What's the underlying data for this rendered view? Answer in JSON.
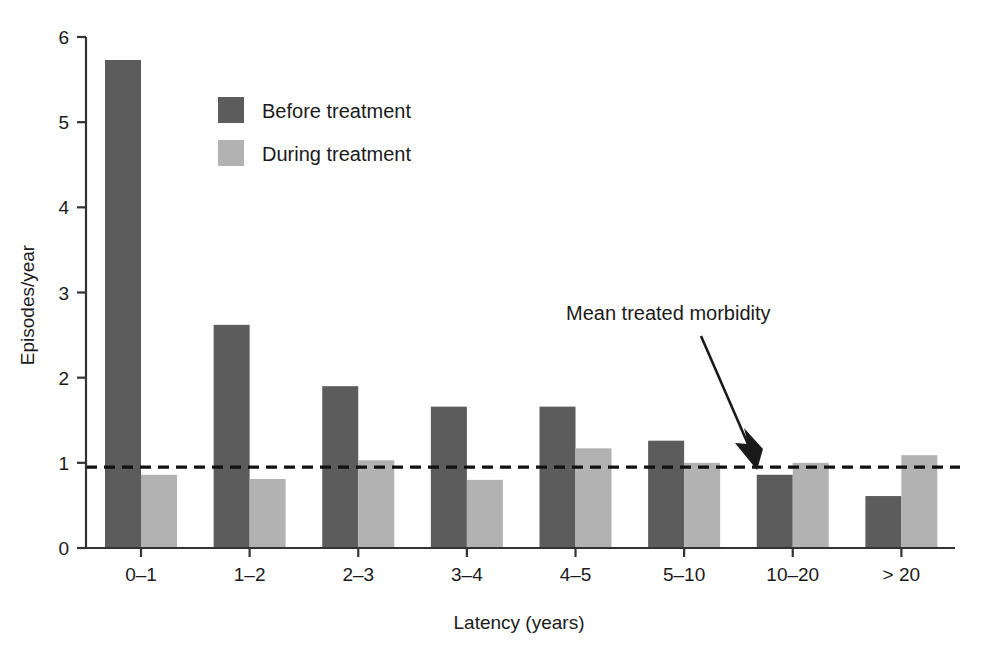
{
  "chart_data": {
    "type": "bar",
    "title": "",
    "subtitle": "",
    "xlabel": "Latency (years)",
    "ylabel": "Episodes/year",
    "categories": [
      "0–1",
      "1–2",
      "2–3",
      "3–4",
      "4–5",
      "5–10",
      "10–20",
      "> 20"
    ],
    "series": [
      {
        "name": "Before treatment",
        "color": "#5c5c5c",
        "values": [
          5.73,
          2.62,
          1.9,
          1.66,
          1.66,
          1.26,
          0.86,
          0.61
        ]
      },
      {
        "name": "During treatment",
        "color": "#b2b2b2",
        "values": [
          0.86,
          0.81,
          1.03,
          0.8,
          1.17,
          1.0,
          1.0,
          1.09
        ]
      }
    ],
    "ylim": [
      0,
      6
    ],
    "yticks": [
      0,
      1,
      2,
      3,
      4,
      5,
      6
    ],
    "ytick_labels": [
      "0",
      "1",
      "2",
      "3",
      "4",
      "5",
      "6"
    ],
    "grid": false,
    "legend_position": "upper-left-inside",
    "reference_line": {
      "label": "Mean treated morbidity",
      "value": 0.95,
      "style": "dashed",
      "color": "#111111"
    },
    "annotations": [
      {
        "text": "Mean treated morbidity",
        "target_category": "10–20",
        "target_value": 0.95
      }
    ]
  },
  "legend": {
    "items": [
      {
        "label": "Before treatment",
        "swatch": "#5c5c5c"
      },
      {
        "label": "During treatment",
        "swatch": "#b2b2b2"
      }
    ]
  },
  "axes": {
    "y_title": "Episodes/year",
    "x_title": "Latency (years)",
    "y_ticks": [
      "6",
      "5",
      "4",
      "3",
      "2",
      "1",
      "0"
    ],
    "x_ticks": [
      "0–1",
      "1–2",
      "2–3",
      "3–4",
      "4–5",
      "5–10",
      "10–20",
      "> 20"
    ]
  },
  "annotation": {
    "text": "Mean treated morbidity"
  }
}
